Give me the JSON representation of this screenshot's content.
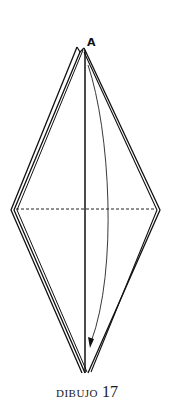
{
  "diagram": {
    "point_label": "A",
    "caption_word": "DIBUJO",
    "caption_number": "17",
    "line_color": "#111111"
  }
}
